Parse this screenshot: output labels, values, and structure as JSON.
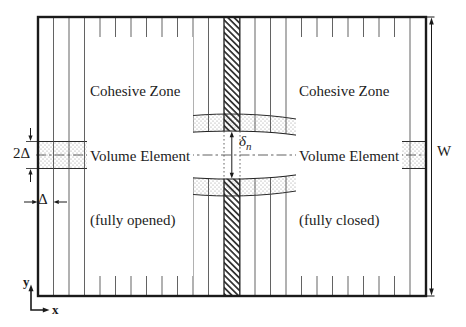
{
  "figure": {
    "callouts": {
      "opened": {
        "lines": [
          "Cohesive Zone",
          "Volume Element",
          "(fully opened)"
        ]
      },
      "closed": {
        "lines": [
          "Cohesive Zone",
          "Volume Element",
          "(fully closed)"
        ]
      }
    },
    "dimensions": {
      "specimen_width": "W",
      "band_height": "2Δ",
      "element_width": "Δ",
      "normal_opening_symbol": "δ",
      "normal_opening_subscript": "n"
    },
    "axes": {
      "x": "x",
      "y": "y"
    },
    "colors": {
      "ink": "#1c1c1c",
      "mesh_line": "#474747",
      "stipple_dot": "#8f8f8f",
      "hatch": "#2e2e2e",
      "background": "#ffffff"
    }
  }
}
